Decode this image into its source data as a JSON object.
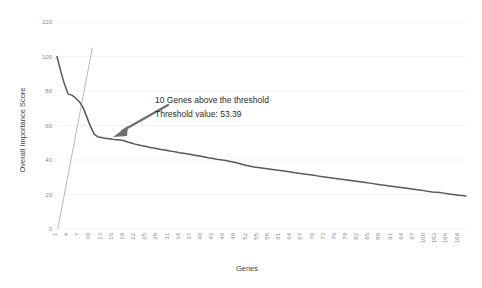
{
  "chart_data": {
    "type": "line",
    "title": "",
    "xlabel": "Genes",
    "ylabel": "Overall Importance Score",
    "ylim": [
      0,
      120
    ],
    "yticks": [
      0,
      20,
      40,
      60,
      80,
      100,
      120
    ],
    "grid": true,
    "legend": false,
    "xtick_labels": [
      "1",
      "4",
      "7",
      "10",
      "13",
      "16",
      "19",
      "22",
      "25",
      "28",
      "31",
      "34",
      "37",
      "40",
      "43",
      "46",
      "49",
      "52",
      "55",
      "58",
      "61",
      "64",
      "67",
      "70",
      "73",
      "76",
      "79",
      "82",
      "85",
      "88",
      "91",
      "94",
      "97",
      "100",
      "103",
      "106",
      "109"
    ],
    "x": [
      1,
      2,
      3,
      4,
      5,
      6,
      7,
      8,
      9,
      10,
      11,
      12,
      13,
      14,
      15,
      16,
      17,
      18,
      19,
      20,
      21,
      22,
      23,
      24,
      25,
      26,
      27,
      28,
      29,
      30,
      31,
      32,
      33,
      34,
      35,
      36,
      37,
      38,
      39,
      40,
      41,
      42,
      43,
      44,
      45,
      46,
      47,
      48,
      49,
      50,
      51,
      52,
      53,
      54,
      55,
      56,
      57,
      58,
      59,
      60,
      61,
      62,
      63,
      64,
      65,
      66,
      67,
      68,
      69,
      70,
      71,
      72,
      73,
      74,
      75,
      76,
      77,
      78,
      79,
      80,
      81,
      82,
      83,
      84,
      85,
      86,
      87,
      88,
      89,
      90,
      91,
      92,
      93,
      94,
      95,
      96,
      97,
      98,
      99,
      100,
      101,
      102,
      103,
      104,
      105,
      106,
      107,
      108,
      109,
      110,
      111
    ],
    "series": [
      {
        "name": "Overall Importance Score",
        "values": [
          100.0,
          91.5,
          84.0,
          78.2,
          77.6,
          76.0,
          73.8,
          70.5,
          65.0,
          59.5,
          55.0,
          53.39,
          53.0,
          52.6,
          52.3,
          52.0,
          51.8,
          51.6,
          51.2,
          50.4,
          49.8,
          49.2,
          48.7,
          48.2,
          47.8,
          47.3,
          46.9,
          46.5,
          46.1,
          45.8,
          45.4,
          45.0,
          44.6,
          44.2,
          43.9,
          43.6,
          43.2,
          42.8,
          42.4,
          42.0,
          41.6,
          41.2,
          40.9,
          40.5,
          40.2,
          39.8,
          39.4,
          39.0,
          38.5,
          38.0,
          37.4,
          36.8,
          36.4,
          36.0,
          35.7,
          35.4,
          35.1,
          34.8,
          34.5,
          34.2,
          33.9,
          33.6,
          33.3,
          33.0,
          32.6,
          32.3,
          32.0,
          31.7,
          31.4,
          31.1,
          30.8,
          30.5,
          30.2,
          29.9,
          29.6,
          29.3,
          29.0,
          28.7,
          28.4,
          28.1,
          27.8,
          27.5,
          27.2,
          26.9,
          26.6,
          26.3,
          26.0,
          25.7,
          25.4,
          25.1,
          24.8,
          24.5,
          24.2,
          23.9,
          23.6,
          23.3,
          23.0,
          22.7,
          22.4,
          22.1,
          21.8,
          21.5,
          21.3,
          21.1,
          20.8,
          20.5,
          20.2,
          19.9,
          19.6,
          19.4,
          19.2
        ]
      }
    ],
    "threshold": {
      "value": 53.39,
      "genes_above": 10,
      "line_x": [
        1.2,
        10.5
      ],
      "line_y": [
        0,
        105
      ]
    },
    "annotations": [
      {
        "name": "threshold-annotation-line1",
        "text": "10 Genes above the threshold"
      },
      {
        "name": "threshold-annotation-line2",
        "text": "Threshold value: 53.39"
      }
    ]
  },
  "colors": {
    "series": "#595959",
    "threshold": "#9a9a9a",
    "grid": "#f0f0f0",
    "tick": "#8a8a8a",
    "annotation": "#2b2b2b",
    "arrow": "#6e6e6e",
    "background": "#ffffff"
  }
}
